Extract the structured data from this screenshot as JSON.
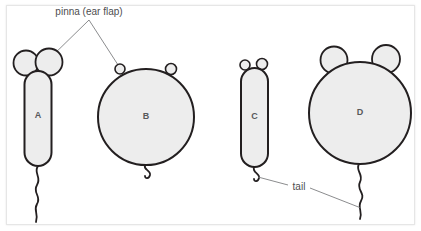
{
  "figure": {
    "background_color": "#ffffff",
    "frame_border_color": "#e6e6e6",
    "shape_fill_color": "#ededed",
    "shape_stroke_color": "#231f20",
    "leader_line_color": "#6d6e71",
    "label_text_color": "#4d4d4f"
  },
  "annotations": [
    {
      "id": "pinna",
      "text": "pinna (ear flap)",
      "points_to": [
        "shape-a-right-ear",
        "shape-b-left-ear"
      ]
    },
    {
      "id": "tail",
      "text": "tail",
      "points_to": [
        "shape-c-tail",
        "shape-d-tail"
      ]
    }
  ],
  "shapes": [
    {
      "id": "a",
      "letter": "A",
      "body_type": "capsule",
      "ear_size": "large",
      "ear_count": 2,
      "tail_type": "long-wavy"
    },
    {
      "id": "b",
      "letter": "B",
      "body_type": "circle",
      "ear_size": "tiny",
      "ear_count": 2,
      "tail_type": "short-curl"
    },
    {
      "id": "c",
      "letter": "C",
      "body_type": "capsule",
      "ear_size": "tiny",
      "ear_count": 2,
      "tail_type": "short-curl"
    },
    {
      "id": "d",
      "letter": "D",
      "body_type": "circle",
      "ear_size": "large",
      "ear_count": 2,
      "tail_type": "long-wavy"
    }
  ]
}
